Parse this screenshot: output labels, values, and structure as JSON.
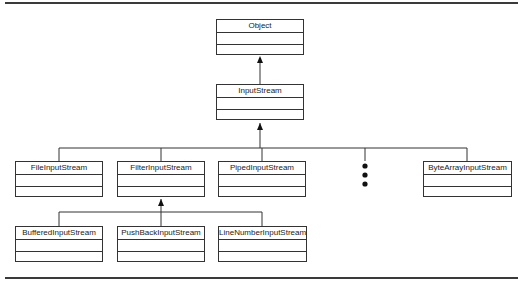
{
  "diagram": {
    "type": "class-hierarchy",
    "classes": {
      "object": "Object",
      "input_stream": "InputStream",
      "file_input_stream": "FileInputStream",
      "filter_input_stream": "FilterInputStream",
      "piped_input_stream": "PipedInputStream",
      "byte_array_input_stream": "ByteArrayInputStream",
      "buffered_input_stream": "BufferedInputStream",
      "push_back_input_stream": "PushBackInputStream",
      "line_number_input_stream": "LineNumberInputStream"
    },
    "relationships": [
      {
        "child": "InputStream",
        "parent": "Object"
      },
      {
        "child": "FileInputStream",
        "parent": "InputStream"
      },
      {
        "child": "FilterInputStream",
        "parent": "InputStream"
      },
      {
        "child": "PipedInputStream",
        "parent": "InputStream"
      },
      {
        "child": "ByteArrayInputStream",
        "parent": "InputStream"
      },
      {
        "child": "BufferedInputStream",
        "parent": "FilterInputStream"
      },
      {
        "child": "PushBackInputStream",
        "parent": "FilterInputStream"
      },
      {
        "child": "LineNumberInputStream",
        "parent": "FilterInputStream"
      }
    ],
    "ellipsis": "more subclasses (vertical dots)"
  }
}
